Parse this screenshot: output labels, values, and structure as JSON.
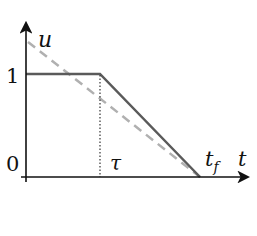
{
  "diagram": {
    "type": "control-profile",
    "axes": {
      "y_label": "u",
      "x_label": "t",
      "y_ticks": [
        "1",
        "0"
      ],
      "x_marks": [
        "τ",
        "t"
      ],
      "x_mark_subscript": "f"
    },
    "series": [
      {
        "name": "solid-profile",
        "style": "solid",
        "color": "#555555",
        "points": [
          [
            0,
            1
          ],
          [
            "τ",
            1
          ],
          [
            "t_f",
            0
          ]
        ]
      },
      {
        "name": "dashed-linear",
        "style": "dashed",
        "color": "#aaaaaa",
        "points": [
          [
            0,
            1.4
          ],
          [
            "t_f",
            0
          ]
        ]
      },
      {
        "name": "tau-marker",
        "style": "dotted",
        "color": "#333333",
        "points": [
          [
            "τ",
            0
          ],
          [
            "τ",
            1
          ]
        ]
      }
    ]
  }
}
